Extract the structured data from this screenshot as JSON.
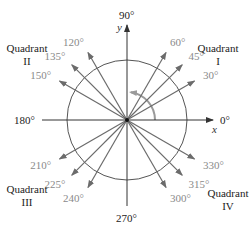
{
  "diagram": {
    "colors": {
      "axis": "#333333",
      "ray": "#6b6b6b",
      "circle": "#555555",
      "arc": "#9a9a9a",
      "angle_label": "#8a8a8a",
      "text": "#222222"
    },
    "axis_labels": {
      "deg0": "0°",
      "deg90": "90°",
      "deg180": "180°",
      "deg270": "270°",
      "x": "x",
      "y": "y"
    },
    "quadrants": [
      {
        "line1": "Quadrant",
        "line2": "I"
      },
      {
        "line1": "Quadrant",
        "line2": "II"
      },
      {
        "line1": "Quadrant",
        "line2": "III"
      },
      {
        "line1": "Quadrant",
        "line2": "IV"
      }
    ],
    "rays": [
      {
        "angle": 30,
        "label": "30°"
      },
      {
        "angle": 45,
        "label": "45°"
      },
      {
        "angle": 60,
        "label": "60°"
      },
      {
        "angle": 120,
        "label": "120°"
      },
      {
        "angle": 135,
        "label": "135°"
      },
      {
        "angle": 150,
        "label": "150°"
      },
      {
        "angle": 210,
        "label": "210°"
      },
      {
        "angle": 225,
        "label": "225°"
      },
      {
        "angle": 240,
        "label": "240°"
      },
      {
        "angle": 300,
        "label": "300°"
      },
      {
        "angle": 315,
        "label": "315°"
      },
      {
        "angle": 330,
        "label": "330°"
      }
    ],
    "rotation_arc": {
      "from_deg": 0,
      "to_deg": 90
    }
  }
}
